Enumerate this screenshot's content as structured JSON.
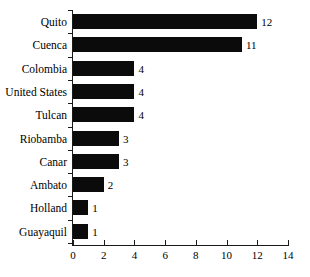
{
  "chart_data": {
    "type": "bar",
    "orientation": "horizontal",
    "title": "",
    "subtitle": "",
    "xlabel": "",
    "ylabel": "",
    "categories": [
      "Quito",
      "Cuenca",
      "Colombia",
      "United States",
      "Tulcan",
      "Riobamba",
      "Canar",
      "Ambato",
      "Holland",
      "Guayaquil"
    ],
    "values": [
      12,
      11,
      4,
      4,
      4,
      3,
      3,
      2,
      1,
      1
    ],
    "data_labels": [
      "12",
      "11",
      "4",
      "4",
      "4",
      "3",
      "3",
      "2",
      "1",
      "1"
    ],
    "xlim": [
      0,
      14
    ],
    "xticks": [
      0,
      2,
      4,
      6,
      8,
      10,
      12,
      14
    ],
    "xtick_labels": [
      "0",
      "2",
      "4",
      "6",
      "8",
      "10",
      "12",
      "14"
    ],
    "grid": false,
    "legend": false,
    "bar_color": "#0b0b0b",
    "axis_color": "#1a1a1a",
    "background_color": "#ffffff"
  }
}
